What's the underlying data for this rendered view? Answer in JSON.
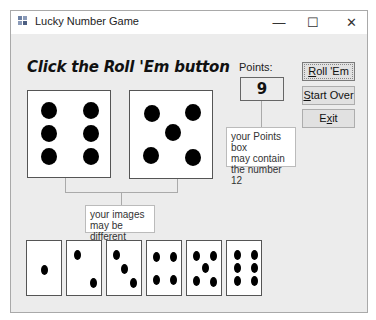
{
  "window": {
    "title": "Lucky Number Game",
    "controls": {
      "minimize": "—",
      "maximize": "☐",
      "close": "✕"
    }
  },
  "main": {
    "heading": "Click the Roll 'Em button",
    "points": {
      "label": "Points:",
      "value": "9"
    },
    "dice": [
      {
        "name": "die-1",
        "value": 6
      },
      {
        "name": "die-2",
        "value": 5
      }
    ],
    "die_images": [
      1,
      2,
      3,
      4,
      5,
      6
    ]
  },
  "buttons": {
    "roll": {
      "mnemonic": "R",
      "rest": "oll 'Em"
    },
    "start_over": {
      "mnemonic": "S",
      "rest": "tart Over"
    },
    "exit": {
      "pre": "E",
      "mnemonic": "x",
      "rest": "it"
    }
  },
  "annotations": {
    "points_note": [
      "your Points box",
      "may contain",
      "the number 12"
    ],
    "images_note": [
      "your images",
      "may be different"
    ]
  }
}
